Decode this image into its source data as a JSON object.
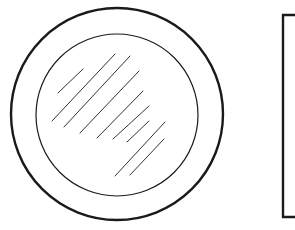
{
  "diagram": {
    "colors": {
      "stroke": "#1a1a1a",
      "background": "#ffffff"
    },
    "outer_circle": {
      "cx": 117,
      "cy": 114,
      "r": 106,
      "stroke_width": 2.4
    },
    "inner_circle": {
      "cx": 117,
      "cy": 115,
      "r": 81,
      "stroke_width": 1.2
    },
    "hatch_lines": [
      {
        "x1": 58,
        "y1": 93,
        "x2": 83,
        "y2": 69
      },
      {
        "x1": 52,
        "y1": 121,
        "x2": 115,
        "y2": 54
      },
      {
        "x1": 64,
        "y1": 127,
        "x2": 130,
        "y2": 56
      },
      {
        "x1": 80,
        "y1": 133,
        "x2": 139,
        "y2": 71
      },
      {
        "x1": 97,
        "y1": 138,
        "x2": 143,
        "y2": 91
      },
      {
        "x1": 113,
        "y1": 139,
        "x2": 149,
        "y2": 106
      },
      {
        "x1": 127,
        "y1": 142,
        "x2": 149,
        "y2": 121
      },
      {
        "x1": 115,
        "y1": 176,
        "x2": 165,
        "y2": 122
      },
      {
        "x1": 130,
        "y1": 175,
        "x2": 164,
        "y2": 139
      }
    ],
    "frame": {
      "x": 283,
      "y": 15,
      "right_edge": 295,
      "bottom": 217,
      "stroke_width": 2.4
    }
  }
}
